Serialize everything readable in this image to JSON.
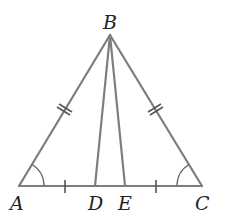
{
  "diagram": {
    "type": "geometry-triangle",
    "line_color": "#7d7d7d",
    "points": {
      "A": {
        "label": "A",
        "x": 19,
        "y": 186
      },
      "B": {
        "label": "B",
        "x": 110,
        "y": 35
      },
      "C": {
        "label": "C",
        "x": 202,
        "y": 186
      },
      "D": {
        "label": "D",
        "x": 95,
        "y": 186
      },
      "E": {
        "label": "E",
        "x": 125,
        "y": 186
      }
    },
    "segments": [
      "AB",
      "BC",
      "AC",
      "BD",
      "BE"
    ],
    "equal_marks": {
      "double_tick": [
        "AB",
        "BC"
      ],
      "single_tick": [
        "AD",
        "EC"
      ],
      "angle_arcs": [
        "A",
        "C"
      ]
    }
  }
}
